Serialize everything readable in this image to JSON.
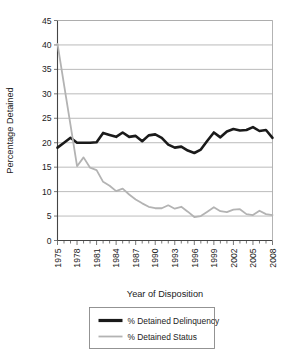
{
  "chart_data": {
    "type": "line",
    "title": "",
    "xlabel": "Year of Disposition",
    "ylabel": "Percentage Detained",
    "xlim": [
      1975,
      2008
    ],
    "ylim": [
      0,
      45
    ],
    "ytick_step": 5,
    "yticks": [
      0,
      5,
      10,
      15,
      20,
      25,
      30,
      35,
      40,
      45
    ],
    "xticks_labeled": [
      1975,
      1978,
      1981,
      1984,
      1987,
      1990,
      1993,
      1996,
      1999,
      2002,
      2005,
      2008
    ],
    "xticks_minor_every": 1,
    "grid": "horizontal",
    "legend_position": "bottom",
    "x": [
      1975,
      1976,
      1977,
      1978,
      1979,
      1980,
      1981,
      1982,
      1983,
      1984,
      1985,
      1986,
      1987,
      1988,
      1989,
      1990,
      1991,
      1992,
      1993,
      1994,
      1995,
      1996,
      1997,
      1998,
      1999,
      2000,
      2001,
      2002,
      2003,
      2004,
      2005,
      2006,
      2007,
      2008
    ],
    "series": [
      {
        "name": "% Detained Delinquency",
        "color": "#1a1a1a",
        "width": 2.6,
        "values": [
          19.0,
          20.0,
          21.0,
          20.0,
          20.0,
          20.0,
          20.1,
          22.0,
          21.6,
          21.2,
          22.1,
          21.2,
          21.4,
          20.3,
          21.5,
          21.7,
          21.0,
          19.6,
          19.0,
          19.2,
          18.4,
          17.9,
          18.6,
          20.4,
          22.1,
          21.1,
          22.3,
          22.8,
          22.5,
          22.6,
          23.2,
          22.4,
          22.6,
          21.0
        ]
      },
      {
        "name": "% Detained Status",
        "color": "#b3b3b3",
        "width": 1.8,
        "values": [
          40.2,
          31.9,
          23.6,
          15.2,
          17.0,
          14.9,
          14.4,
          12.0,
          11.2,
          10.1,
          10.6,
          9.4,
          8.4,
          7.6,
          6.9,
          6.6,
          6.6,
          7.2,
          6.5,
          6.9,
          5.9,
          4.8,
          5.0,
          5.9,
          6.8,
          6.0,
          5.8,
          6.3,
          6.4,
          5.4,
          5.2,
          6.1,
          5.4,
          5.2
        ]
      }
    ]
  },
  "legend": {
    "items": [
      {
        "label": "% Detained Delinquency",
        "color": "#1a1a1a",
        "width": 3.2
      },
      {
        "label": "% Detained Status",
        "color": "#b3b3b3",
        "width": 1.8
      }
    ]
  }
}
